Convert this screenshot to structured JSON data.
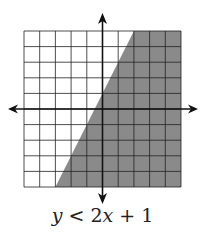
{
  "chart_data": {
    "type": "inequality-graph",
    "title": "y < 2x + 1",
    "inequality": {
      "lhs": "y",
      "operator": "<",
      "rhs": "2x + 1",
      "slope": 2,
      "intercept": 1,
      "boundary_style": "dashed",
      "shaded_side": "below"
    },
    "xlabel": "x",
    "ylabel": "y",
    "xlim": [
      -5,
      5
    ],
    "ylim": [
      -5,
      5
    ],
    "x_ticks": [
      "-5",
      "-4",
      "-3",
      "-2",
      "-1",
      "1",
      "2",
      "3",
      "4",
      "5"
    ],
    "y_ticks": [
      "5",
      "4",
      "3",
      "2",
      "1",
      "-1",
      "-2",
      "-3",
      "-4",
      "-5"
    ],
    "origin_label": "0",
    "grid": true,
    "boundary_points": [
      [
        -3,
        -5
      ],
      [
        2,
        5
      ]
    ],
    "colors": {
      "shade": "#8a8a8a",
      "grid": "#222222",
      "axis": "#111111"
    }
  },
  "caption": {
    "y": "y",
    "op": " < 2",
    "x": "x",
    "rest": " + 1"
  }
}
